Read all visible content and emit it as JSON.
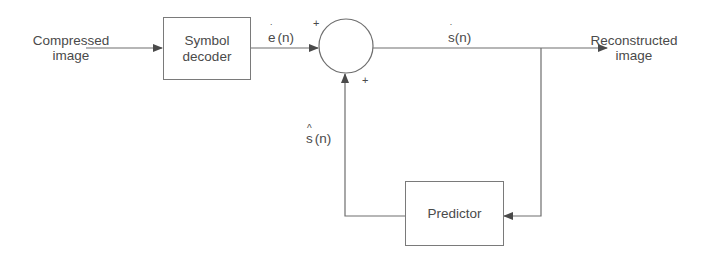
{
  "diagram": {
    "input": {
      "line1": "Compressed",
      "line2": "image"
    },
    "output": {
      "line1": "Reconstructed",
      "line2": "image"
    },
    "blocks": {
      "symbol_decoder": {
        "line1": "Symbol",
        "line2": "decoder"
      },
      "predictor": {
        "label": "Predictor"
      },
      "summer": {
        "shape": "circle",
        "inputs_signs": [
          "+",
          "+"
        ]
      }
    },
    "signals": {
      "error": {
        "base": "e",
        "accent": "˙",
        "suffix": "(n)"
      },
      "reconstructed": {
        "base": "s",
        "accent": "˙",
        "suffix": "(n)"
      },
      "prediction": {
        "base": "s",
        "accent": "^",
        "suffix": "(n)"
      }
    },
    "signs": {
      "top": "+",
      "bottom": "+"
    },
    "colors": {
      "line": "#6e6e6e",
      "text": "#4a4a4a",
      "background": "#ffffff"
    }
  }
}
